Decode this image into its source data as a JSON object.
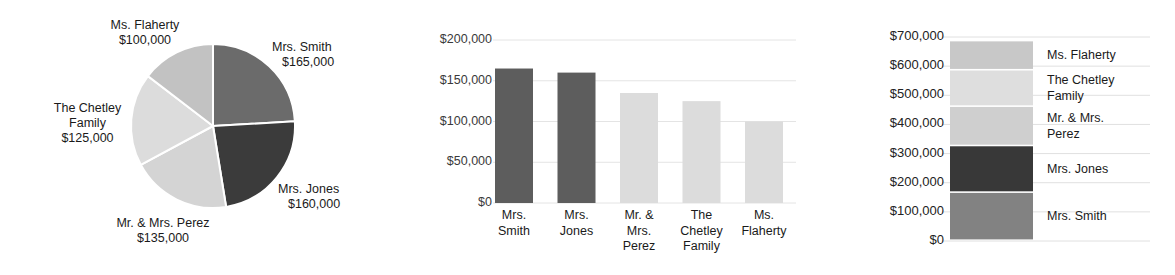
{
  "chart_data": [
    {
      "type": "pie",
      "title": "",
      "id": "pie-donations",
      "categories": [
        "Mrs. Smith",
        "Mrs. Jones",
        "Mr. & Mrs. Perez",
        "The Chetley Family",
        "Ms. Flaherty"
      ],
      "values": [
        165000,
        160000,
        135000,
        125000,
        100000
      ],
      "value_labels": [
        "$165,000",
        "$160,000",
        "$135,000",
        "$125,000",
        "$100,000"
      ],
      "colors": [
        "#6b6b6b",
        "#3b3b3b",
        "#d4d4d4",
        "#dcdcdc",
        "#c2c2c2"
      ],
      "slice_gap_color": "#ffffff",
      "legend": "labels-outside",
      "labels": [
        {
          "name": "Ms. Flaherty",
          "amount": "$100,000"
        },
        {
          "name": "Mrs. Smith",
          "amount": "$165,000"
        },
        {
          "name": "Mrs. Jones",
          "amount": "$160,000"
        },
        {
          "name": "Mr. & Mrs. Perez",
          "amount": "$135,000"
        },
        {
          "name": "The Chetley",
          "name2": "Family",
          "amount": "$125,000"
        }
      ]
    },
    {
      "type": "bar",
      "id": "bar-donations",
      "title": "",
      "xlabel": "",
      "ylabel": "",
      "categories": [
        "Mrs. Smith",
        "Mrs. Jones",
        "Mr. & Mrs. Perez",
        "The Chetley Family",
        "Ms. Flaherty"
      ],
      "category_lines": [
        [
          "Mrs.",
          "Smith"
        ],
        [
          "Mrs.",
          "Jones"
        ],
        [
          "Mr. &",
          "Mrs.",
          "Perez"
        ],
        [
          "The",
          "Chetley",
          "Family"
        ],
        [
          "Ms.",
          "Flaherty"
        ]
      ],
      "values": [
        165000,
        160000,
        135000,
        125000,
        100000
      ],
      "colors": [
        "#5d5d5d",
        "#5d5d5d",
        "#dcdcdc",
        "#dcdcdc",
        "#dcdcdc"
      ],
      "ylim": [
        0,
        200000
      ],
      "yticks": [
        200000,
        150000,
        100000,
        50000,
        0
      ],
      "ytick_labels": [
        "$200,000",
        "$150,000",
        "$100,000",
        "$50,000",
        "$0"
      ],
      "grid": true,
      "gridline_color": "#e4e4e4"
    },
    {
      "type": "bar",
      "subtype": "stacked",
      "id": "stacked-donations",
      "title": "",
      "xlabel": "",
      "ylabel": "",
      "categories": [
        "Total"
      ],
      "series": [
        {
          "name": "Mrs. Smith",
          "values": [
            165000
          ],
          "color": "#828282"
        },
        {
          "name": "Mrs. Jones",
          "values": [
            160000
          ],
          "color": "#383838"
        },
        {
          "name": "Mr. & Mrs. Perez",
          "values": [
            135000
          ],
          "color": "#cfcfcf"
        },
        {
          "name": "The Chetley Family",
          "values": [
            125000
          ],
          "color": "#dedede"
        },
        {
          "name": "Ms. Flaherty",
          "values": [
            100000
          ],
          "color": "#c8c8c8"
        }
      ],
      "legend_entries": [
        {
          "lines": [
            "Ms. Flaherty"
          ]
        },
        {
          "lines": [
            "The Chetley",
            "Family"
          ]
        },
        {
          "lines": [
            "Mr. & Mrs.",
            "Perez"
          ]
        },
        {
          "lines": [
            "Mrs. Jones"
          ]
        },
        {
          "lines": [
            "Mrs. Smith"
          ]
        }
      ],
      "ylim": [
        0,
        700000
      ],
      "yticks": [
        700000,
        600000,
        500000,
        400000,
        300000,
        200000,
        100000,
        0
      ],
      "ytick_labels": [
        "$700,000",
        "$600,000",
        "$500,000",
        "$400,000",
        "$300,000",
        "$200,000",
        "$100,000",
        "$0"
      ],
      "grid": true,
      "gridline_color": "#e0e0e0",
      "legend": "right"
    }
  ]
}
